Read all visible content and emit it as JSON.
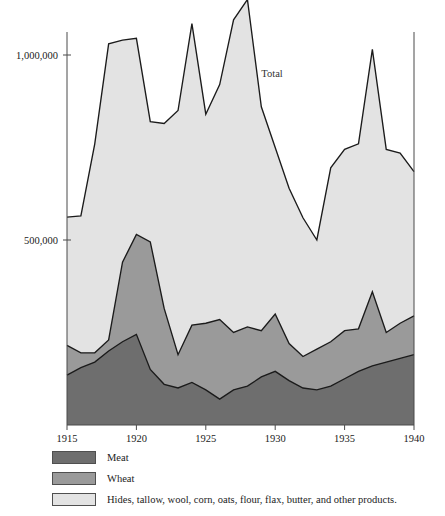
{
  "chart_data": {
    "type": "area",
    "title": "",
    "subtitle": "",
    "xlabel": "",
    "ylabel": "",
    "stacked": true,
    "grid": false,
    "legend_position": "below",
    "xlim": [
      1915,
      1940
    ],
    "ylim": [
      0,
      1100000
    ],
    "x_tick_labels": [
      "1915",
      "1920",
      "1925",
      "1930",
      "1935",
      "1940"
    ],
    "x_ticks": [
      1915,
      1920,
      1925,
      1930,
      1935,
      1940
    ],
    "y_tick_labels": [
      "500,000",
      "1,000,000"
    ],
    "y_ticks": [
      500000,
      1000000
    ],
    "x": [
      1915,
      1916,
      1917,
      1918,
      1919,
      1920,
      1921,
      1922,
      1923,
      1924,
      1925,
      1926,
      1927,
      1928,
      1929,
      1930,
      1931,
      1932,
      1933,
      1934,
      1935,
      1936,
      1937,
      1938,
      1939,
      1940
    ],
    "annotations": [
      {
        "text": "Total",
        "x": 1929,
        "y": 940000
      }
    ],
    "series": [
      {
        "name": "Meat",
        "color": "#6e6e6e",
        "values": [
          135000,
          155000,
          170000,
          200000,
          225000,
          245000,
          150000,
          110000,
          100000,
          115000,
          95000,
          70000,
          95000,
          105000,
          130000,
          145000,
          120000,
          100000,
          95000,
          105000,
          125000,
          145000,
          160000,
          170000,
          180000,
          190000
        ]
      },
      {
        "name": "Wheat",
        "color": "#9a9a9a",
        "values": [
          80000,
          40000,
          25000,
          30000,
          215000,
          270000,
          345000,
          205000,
          90000,
          155000,
          180000,
          215000,
          155000,
          160000,
          125000,
          155000,
          100000,
          85000,
          110000,
          120000,
          130000,
          115000,
          200000,
          80000,
          95000,
          105000
        ]
      },
      {
        "name": "Hides, tallow, wool, corn, oats, flour, flax, butter, and other products.",
        "color": "#e3e3e3",
        "values": [
          347000,
          370000,
          565000,
          800000,
          600000,
          530000,
          325000,
          500000,
          660000,
          815000,
          565000,
          635000,
          845000,
          885000,
          605000,
          450000,
          420000,
          375000,
          295000,
          470000,
          490000,
          500000,
          655000,
          495000,
          460000,
          390000
        ]
      }
    ],
    "totals": [
      562000,
      565000,
      760000,
      1030000,
      1040000,
      1045000,
      820000,
      815000,
      850000,
      1085000,
      840000,
      920000,
      1095000,
      1150000,
      860000,
      750000,
      640000,
      560000,
      500000,
      695000,
      745000,
      760000,
      1015000,
      745000,
      735000,
      685000
    ]
  },
  "legend": {
    "entries": [
      {
        "label": "Meat",
        "color": "#6e6e6e"
      },
      {
        "label": "Wheat",
        "color": "#9a9a9a"
      },
      {
        "label": "Hides, tallow, wool, corn, oats, flour, flax, butter, and other products.",
        "color": "#e3e3e3"
      }
    ]
  }
}
